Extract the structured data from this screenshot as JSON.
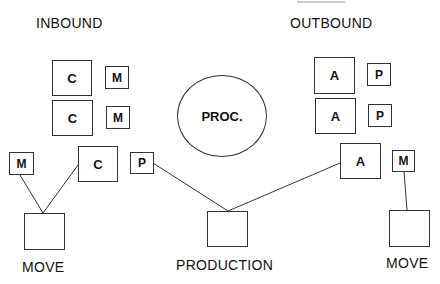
{
  "labels": {
    "inbound": "INBOUND",
    "outbound": "OUTBOUND",
    "move_left": "MOVE",
    "production": "PRODUCTION",
    "move_right": "MOVE"
  },
  "center": {
    "label": "PROC."
  },
  "inbound": {
    "rows": [
      {
        "big": "C",
        "small": "M"
      },
      {
        "big": "C",
        "small": "M"
      }
    ]
  },
  "outbound": {
    "rows": [
      {
        "big": "A",
        "small": "P"
      },
      {
        "big": "A",
        "small": "P"
      }
    ]
  },
  "lower": {
    "m_left": "M",
    "c_mid": "C",
    "p_mid": "P",
    "a_right": "A",
    "m_right": "M"
  }
}
